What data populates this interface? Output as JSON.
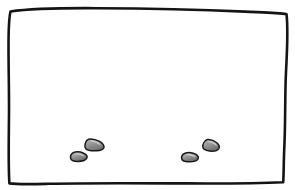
{
  "scene": {
    "title": "hand-drawn empty room with pebbles",
    "width": 295,
    "height": 190,
    "background_color": "#ffffff",
    "paper_color": "#ffffff"
  },
  "frame": {
    "name": "sketched rectangular border",
    "stroke_color": "#141414",
    "fill_color": "#ffffff",
    "stroke_width": 2.6,
    "style": "wobbly ink outline",
    "path": "M10.5,11.5 C30,8.6 60,8.0 96,8.2 C140,8.4 200,9.6 245,11.6 C262,12.4 278,12.6 286.5,14.2 C288.2,28 287.2,50 286.0,72 C284.8,96 285.6,124 284.2,150 C283.6,164 283.8,174 283.2,182.2 C262,183.2 225,183.6 186,183.4 C140,183.2 88,182.8 48,183.8 C32,184.2 18,184.6 9.4,183.4 C8.2,166 8.8,140 9.0,114 C9.2,86 8.2,58 8.6,36 C8.8,24 9.4,16 10.5,11.5 Z"
  },
  "pebbles": [
    {
      "id": "pebble-left-upper",
      "label": "small stone",
      "fill_light": "#b9b9b9",
      "fill_dark": "#707070",
      "stroke_color": "#1a1a1a",
      "path": "M88.6,139.2 C92.4,138.4 96.2,139.6 99.6,141.4 C102.4,143.0 104.2,145.2 104.0,147.4 C103.6,149.6 100.4,150.6 96.2,150.8 C91.6,151.0 87.2,150.2 85.6,148.4 C84.2,146.6 85.2,142.6 86.6,140.6 Z",
      "highlight": "M89.8,140.6 C92.6,140.0 95.8,141.0 98.4,142.6 C100.0,143.6 100.8,144.6 100.2,145.4 C98.4,144.0 94.8,142.2 91.0,141.6 Z"
    },
    {
      "id": "pebble-left-lower",
      "label": "small stone",
      "fill_light": "#c2c2c2",
      "fill_dark": "#6d6d6d",
      "stroke_color": "#1a1a1a",
      "path": "M73.0,152.8 C76.4,151.4 80.4,151.8 83.6,153.2 C86.4,154.4 87.6,156.2 86.8,158.2 C85.8,160.2 82.0,161.4 78.0,161.4 C74.0,161.4 71.0,160.4 70.6,158.4 C70.2,156.4 71.2,154.0 73.0,152.8 Z",
      "highlight": "M74.2,154.0 C77.0,153.0 80.2,153.4 82.6,154.6 C83.8,155.2 84.2,156.0 83.6,156.6 C81.8,155.4 78.4,154.4 75.2,154.6 Z"
    },
    {
      "id": "pebble-right-upper",
      "label": "small stone",
      "fill_light": "#bdbdbd",
      "fill_dark": "#6f6f6f",
      "stroke_color": "#1a1a1a",
      "path": "M207.0,139.6 C210.6,139.0 214.2,140.6 216.8,142.8 C219.0,144.6 219.8,146.8 218.8,148.6 C217.6,150.6 213.4,151.4 209.4,151.0 C205.4,150.6 203.0,149.0 202.8,146.8 C202.6,144.0 204.6,140.8 207.0,139.6 Z",
      "highlight": "M208.2,141.0 C211.0,140.6 213.8,141.8 215.8,143.6 C216.8,144.4 217.0,145.4 216.4,146.0 C214.6,144.2 211.4,142.4 208.4,142.0 Z"
    },
    {
      "id": "pebble-right-lower",
      "label": "small stone",
      "fill_light": "#c4c4c4",
      "fill_dark": "#6c6c6c",
      "stroke_color": "#1a1a1a",
      "path": "M185.0,153.2 C188.6,152.0 192.6,152.6 195.6,154.2 C198.2,155.6 199.0,157.6 197.8,159.4 C196.4,161.2 192.4,162.0 188.4,161.8 C184.2,161.6 181.8,160.4 181.6,158.4 C181.4,156.2 183.0,154.0 185.0,153.2 Z",
      "highlight": "M186.2,154.4 C189.2,153.6 192.2,154.2 194.4,155.6 C195.4,156.2 195.6,157.0 195.0,157.6 C193.2,156.2 190.0,155.0 187.0,155.2 Z"
    }
  ]
}
